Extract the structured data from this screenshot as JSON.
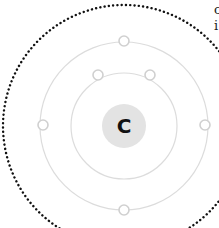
{
  "diagram": {
    "nucleus": {
      "symbol": "C",
      "cx": 124,
      "cy": 126,
      "r": 22,
      "fill": "#e3e3e3",
      "text_color": "#111111"
    },
    "orbits": [
      {
        "name": "inner-shell",
        "r": 53,
        "stroke": "#dcdcdc",
        "electrons": [
          {
            "cx": 98,
            "cy": 75
          },
          {
            "cx": 150,
            "cy": 75
          }
        ]
      },
      {
        "name": "outer-shell",
        "r": 84,
        "stroke": "#dcdcdc",
        "electrons": [
          {
            "cx": 124,
            "cy": 41
          },
          {
            "cx": 43,
            "cy": 125
          },
          {
            "cx": 205,
            "cy": 125
          },
          {
            "cx": 124,
            "cy": 210
          }
        ]
      }
    ],
    "boundary": {
      "r": 121,
      "stroke": "#111111",
      "style": "dotted"
    },
    "electron_style": {
      "r": 5,
      "fill": "#ffffff",
      "stroke": "#d0d0d0"
    }
  },
  "edge_text": [
    "c",
    "i"
  ]
}
